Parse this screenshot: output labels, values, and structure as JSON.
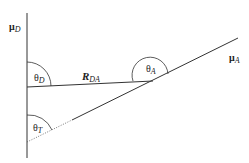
{
  "diagram": {
    "type": "vector-geometry",
    "labels": {
      "mu_d": {
        "main": "μ",
        "sub": "D"
      },
      "mu_a": {
        "main": "μ",
        "sub": "A"
      },
      "r_da": {
        "main": "R",
        "sub": "DA"
      },
      "theta_d": {
        "main": "θ",
        "sub": "D"
      },
      "theta_a": {
        "main": "θ",
        "sub": "A"
      },
      "theta_t": {
        "main": "θ",
        "sub": "T"
      }
    },
    "colors": {
      "line": "#333333",
      "background": "#ffffff"
    }
  }
}
